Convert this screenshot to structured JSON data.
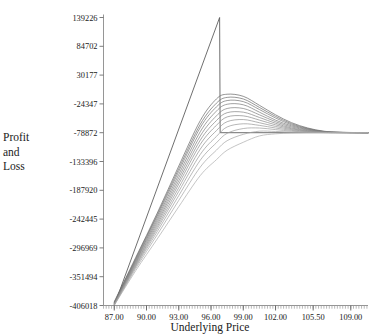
{
  "chart_data": {
    "type": "line",
    "title": "",
    "xlabel": "Underlying Price",
    "ylabel": "Profit and Loss",
    "ylabel_lines": [
      "Profit",
      "and",
      "Loss"
    ],
    "xlim": [
      86.0,
      110.6
    ],
    "ylim": [
      -406018,
      139226
    ],
    "grid": false,
    "legend": false,
    "x_tick_labels": [
      "87.00",
      "90.00",
      "93.00",
      "96.00",
      "99.00",
      "102.00",
      "105.50",
      "109.00"
    ],
    "x_tick_values": [
      87.0,
      90.0,
      93.0,
      96.0,
      99.0,
      102.0,
      105.5,
      109.0
    ],
    "y_tick_labels": [
      "139226",
      "84702",
      "30177",
      "-24347",
      "-78872",
      "-133396",
      "-187920",
      "-242445",
      "-296969",
      "-351494",
      "-406018"
    ],
    "y_tick_values": [
      139226,
      84702,
      30177,
      -24347,
      -78872,
      -133396,
      -187920,
      -242445,
      -296969,
      -351494,
      -406018
    ],
    "series": [
      {
        "name": "expiration-payoff",
        "color": "#555555",
        "x": [
          87.0,
          96.8,
          96.85,
          110.6
        ],
        "values": [
          -406018,
          139226,
          -78872,
          -78872
        ]
      },
      {
        "name": "decay-curve-1",
        "color": "#666666",
        "x": [
          87.0,
          89.0,
          91.0,
          93.0,
          95.0,
          96.5,
          97.5,
          99.0,
          100.5,
          102.0,
          103.5,
          105.0,
          106.5,
          108.0,
          110.6
        ],
        "values": [
          -399000,
          -315000,
          -231000,
          -142000,
          -56000,
          -15000,
          -6000,
          -10000,
          -27000,
          -45000,
          -60000,
          -70000,
          -76000,
          -78000,
          -78872
        ]
      },
      {
        "name": "decay-curve-2",
        "color": "#6c6c6c",
        "x": [
          87.0,
          89.0,
          91.0,
          93.0,
          95.0,
          96.5,
          97.5,
          99.0,
          100.5,
          102.0,
          103.5,
          105.0,
          106.5,
          108.0,
          110.6
        ],
        "values": [
          -400000,
          -317000,
          -234000,
          -147000,
          -63000,
          -23000,
          -12000,
          -15000,
          -31000,
          -48000,
          -62000,
          -71000,
          -76500,
          -78200,
          -78872
        ]
      },
      {
        "name": "decay-curve-3",
        "color": "#727272",
        "x": [
          87.0,
          89.0,
          91.0,
          93.0,
          95.0,
          96.5,
          97.5,
          99.0,
          100.5,
          102.0,
          103.5,
          105.0,
          106.5,
          108.0,
          110.6
        ],
        "values": [
          -401000,
          -319000,
          -237000,
          -152000,
          -69000,
          -30000,
          -18000,
          -20000,
          -35000,
          -51000,
          -64000,
          -72000,
          -77000,
          -78300,
          -78872
        ]
      },
      {
        "name": "decay-curve-4",
        "color": "#787878",
        "x": [
          87.0,
          89.0,
          91.0,
          93.0,
          95.0,
          96.5,
          97.5,
          99.0,
          100.5,
          102.0,
          103.5,
          105.0,
          106.5,
          108.0,
          110.6
        ],
        "values": [
          -402000,
          -321000,
          -241000,
          -158000,
          -77000,
          -38000,
          -25000,
          -26000,
          -40000,
          -55000,
          -66000,
          -73000,
          -77200,
          -78400,
          -78872
        ]
      },
      {
        "name": "decay-curve-5",
        "color": "#7e7e7e",
        "x": [
          87.0,
          89.0,
          91.0,
          93.0,
          95.0,
          96.5,
          97.5,
          99.0,
          100.5,
          102.0,
          103.5,
          105.0,
          106.5,
          108.0,
          110.6
        ],
        "values": [
          -402500,
          -323000,
          -245000,
          -164000,
          -85000,
          -47000,
          -33000,
          -33000,
          -45000,
          -58000,
          -68000,
          -74000,
          -77500,
          -78450,
          -78872
        ]
      },
      {
        "name": "decay-curve-6",
        "color": "#848484",
        "x": [
          87.0,
          89.0,
          91.0,
          93.0,
          95.0,
          96.5,
          97.5,
          99.0,
          100.5,
          102.0,
          103.5,
          105.0,
          106.5,
          108.0,
          110.6
        ],
        "values": [
          -403000,
          -325000,
          -249000,
          -170000,
          -93000,
          -56000,
          -41000,
          -40000,
          -50000,
          -61000,
          -70000,
          -75000,
          -77800,
          -78550,
          -78872
        ]
      },
      {
        "name": "decay-curve-7",
        "color": "#8a8a8a",
        "x": [
          87.0,
          89.0,
          91.0,
          93.0,
          95.0,
          96.5,
          97.5,
          99.0,
          100.5,
          102.0,
          103.5,
          105.0,
          106.5,
          108.0,
          110.6
        ],
        "values": [
          -403500,
          -327000,
          -253000,
          -176000,
          -101000,
          -65000,
          -49000,
          -47000,
          -55000,
          -64000,
          -71500,
          -75800,
          -78000,
          -78600,
          -78872
        ]
      },
      {
        "name": "decay-curve-8",
        "color": "#909090",
        "x": [
          87.0,
          89.0,
          91.0,
          93.0,
          95.0,
          96.5,
          97.5,
          99.0,
          100.5,
          102.0,
          103.5,
          105.0,
          106.5,
          108.0,
          110.6
        ],
        "values": [
          -404000,
          -329000,
          -257000,
          -183000,
          -110000,
          -75000,
          -58000,
          -54000,
          -60000,
          -67000,
          -73000,
          -76500,
          -78200,
          -78700,
          -78872
        ]
      },
      {
        "name": "decay-curve-9",
        "color": "#969696",
        "x": [
          87.0,
          89.0,
          91.0,
          93.0,
          95.0,
          96.5,
          97.5,
          99.0,
          100.5,
          102.0,
          103.5,
          105.0,
          106.5,
          108.0,
          110.6
        ],
        "values": [
          -404500,
          -331000,
          -261000,
          -190000,
          -120000,
          -86000,
          -68000,
          -62000,
          -65000,
          -70000,
          -74500,
          -77000,
          -78350,
          -78750,
          -78872
        ]
      },
      {
        "name": "decay-curve-10",
        "color": "#9c9c9c",
        "x": [
          87.0,
          89.0,
          91.0,
          93.0,
          95.0,
          96.5,
          97.5,
          99.0,
          100.5,
          102.0,
          103.5,
          105.0,
          106.5,
          108.0,
          110.6
        ],
        "values": [
          -405000,
          -333000,
          -266000,
          -198000,
          -131000,
          -98000,
          -80000,
          -71000,
          -70000,
          -73000,
          -76000,
          -77600,
          -78500,
          -78800,
          -78872
        ]
      },
      {
        "name": "decay-curve-11",
        "color": "#a4a4a4",
        "x": [
          87.0,
          89.0,
          91.0,
          93.0,
          95.0,
          96.5,
          97.5,
          99.0,
          100.5,
          102.0,
          103.5,
          105.0,
          106.5,
          108.0,
          110.6
        ],
        "values": [
          -405300,
          -336000,
          -272000,
          -207000,
          -144000,
          -112000,
          -94000,
          -82000,
          -76000,
          -76500,
          -77500,
          -78200,
          -78650,
          -78830,
          -78872
        ]
      },
      {
        "name": "decay-curve-12",
        "color": "#acacac",
        "x": [
          87.0,
          89.0,
          91.0,
          93.0,
          95.0,
          96.5,
          97.5,
          99.0,
          100.5,
          102.0,
          103.5,
          105.0,
          106.5,
          108.0,
          110.6
        ],
        "values": [
          -405700,
          -340000,
          -280000,
          -219000,
          -160000,
          -130000,
          -112000,
          -97000,
          -85000,
          -81000,
          -79500,
          -78900,
          -78850,
          -78860,
          -78872
        ]
      }
    ]
  },
  "axis": {
    "x_title": "Underlying Price",
    "y_title_lines": [
      "Profit",
      "and",
      "Loss"
    ]
  }
}
